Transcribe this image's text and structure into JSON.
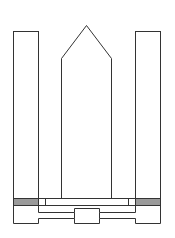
{
  "diagram": {
    "colors": {
      "background": "#ffffff",
      "stroke": "#333333",
      "band_fill": "#9a9a9a"
    },
    "components": [
      {
        "id": "left-tower",
        "shape": "rectangle"
      },
      {
        "id": "center-body",
        "shape": "pentagon-pointed-top"
      },
      {
        "id": "right-tower",
        "shape": "rectangle"
      },
      {
        "id": "left-shaded-band",
        "shape": "rectangle"
      },
      {
        "id": "right-shaded-band",
        "shape": "rectangle"
      },
      {
        "id": "platform",
        "shape": "rectangle"
      },
      {
        "id": "base",
        "shape": "stepped-outline"
      }
    ]
  }
}
